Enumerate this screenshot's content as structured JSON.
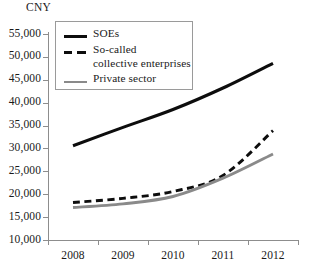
{
  "chart_data": {
    "type": "line",
    "title": "",
    "subtitle": "",
    "unit_label": "CNY",
    "xlabel": "",
    "ylabel": "",
    "x": [
      "2008",
      "2009",
      "2010",
      "2011",
      "2012"
    ],
    "categories": [
      "2008",
      "2009",
      "2010",
      "2011",
      "2012"
    ],
    "ylim": [
      10000,
      55000
    ],
    "yticks": [
      "10,000",
      "15,000",
      "20,000",
      "25,000",
      "30,000",
      "35,000",
      "40,000",
      "45,000",
      "50,000",
      "55,000"
    ],
    "ytick_values": [
      10000,
      15000,
      20000,
      25000,
      30000,
      35000,
      40000,
      45000,
      50000,
      55000
    ],
    "grid": false,
    "legend_position": "top-left",
    "series": [
      {
        "name": "SOEs",
        "style": "solid",
        "color": "#0d0d0d",
        "values": [
          30600,
          34600,
          38500,
          43200,
          48600
        ]
      },
      {
        "name": "So-called\ncollective enterprises",
        "style": "dashed",
        "color": "#0d0d0d",
        "values": [
          18200,
          19100,
          20600,
          24100,
          33900
        ]
      },
      {
        "name": "Private sector",
        "style": "solid",
        "color": "#8a8a8a",
        "values": [
          17100,
          17900,
          19500,
          23500,
          28800
        ]
      }
    ]
  },
  "colors": {
    "soes": "#0d0d0d",
    "collective": "#0d0d0d",
    "private": "#8a8a8a",
    "axis": "#8d8d8d",
    "text": "#1a1a1a",
    "background": "#ffffff"
  }
}
